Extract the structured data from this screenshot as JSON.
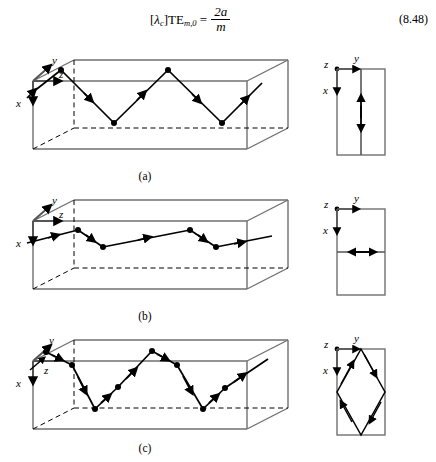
{
  "equation": {
    "label_bracket_open": "[",
    "lambda": "λ",
    "lambda_sub": "c",
    "label_bracket_close": "]",
    "mode": "TE",
    "mode_sub": "m,0",
    "equals": "=",
    "numerator": "2a",
    "denominator": "m",
    "number": "(8.48)",
    "plain_text": "[λc]TE m,0 = 2a/m"
  },
  "panels": [
    {
      "id": "a",
      "caption": "(a)",
      "mode": "TE m,0",
      "description": "Rectangular waveguide with zigzag ray bouncing between top and bottom walls",
      "axes": {
        "x_label": "x",
        "y_label": "y",
        "z_label": "z",
        "x_direction": "down",
        "y_direction": "up-right",
        "z_direction": "right"
      },
      "end_view": {
        "axes": {
          "x_label": "x",
          "y_label": "y",
          "z_label": "z"
        },
        "ray_type": "vertical-line",
        "arrows": [
          "up",
          "down"
        ]
      }
    },
    {
      "id": "b",
      "caption": "(b)",
      "mode": "TE 0,n",
      "description": "Rectangular waveguide with shallow zigzag ray bouncing between side walls",
      "axes": {
        "x_label": "x",
        "y_label": "y",
        "z_label": "z",
        "x_direction": "down",
        "y_direction": "up-right",
        "z_direction": "right"
      },
      "end_view": {
        "axes": {
          "x_label": "x",
          "y_label": "y",
          "z_label": "z"
        },
        "ray_type": "horizontal-line",
        "arrows": [
          "left",
          "right"
        ]
      }
    },
    {
      "id": "c",
      "caption": "(c)",
      "mode": "TE m,n",
      "description": "Rectangular waveguide with combined zigzag ray bouncing off all four walls",
      "axes": {
        "x_label": "x",
        "y_label": "y",
        "z_label": "z",
        "x_direction": "down",
        "y_direction": "up-right",
        "z_direction": "right"
      },
      "end_view": {
        "axes": {
          "x_label": "x",
          "y_label": "y",
          "z_label": "z"
        },
        "ray_type": "diamond",
        "arrows": [
          "down-left",
          "down-right",
          "up-left",
          "up-right"
        ]
      }
    }
  ],
  "colors": {
    "ink": "#000000",
    "box_edge": "#6f6f6f",
    "background": "#ffffff"
  }
}
